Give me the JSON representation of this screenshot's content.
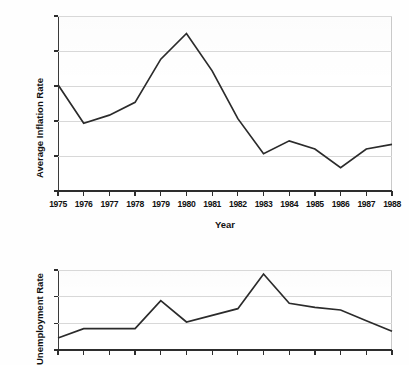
{
  "document": {
    "kind": "scanned-figure-page",
    "background_color": "#ffffff",
    "line_color": "#2b2b2b",
    "grid_color": "#d8d8d8",
    "axis_color": "#2d2d2d"
  },
  "charts": [
    {
      "id": "inflation",
      "ylabel": "Average Inflation Rate",
      "xlabel": "Year"
    },
    {
      "id": "unemployment",
      "ylabel": "Unemployment Rate",
      "xlabel": ""
    }
  ],
  "chart_data": [
    {
      "type": "line",
      "title": "",
      "xlabel": "Year",
      "ylabel": "Average Inflation Rate",
      "categories": [
        "1975",
        "1976",
        "1977",
        "1978",
        "1979",
        "1980",
        "1981",
        "1982",
        "1983",
        "1984",
        "1985",
        "1986",
        "1987",
        "1988"
      ],
      "x": [
        1975,
        1976,
        1977,
        1978,
        1979,
        1980,
        1981,
        1982,
        1983,
        1984,
        1985,
        1986,
        1987,
        1988
      ],
      "values": [
        9.1,
        5.8,
        6.5,
        7.6,
        11.3,
        13.5,
        10.3,
        6.2,
        3.2,
        4.3,
        3.6,
        2.0,
        3.6,
        4.0
      ],
      "ylim": [
        0,
        15
      ],
      "yticks": [
        0,
        3,
        6,
        9,
        12,
        15
      ],
      "ytick_labels": [
        "0",
        "3",
        "6",
        "9",
        "12",
        "15"
      ],
      "xtick_labels": [
        "1975",
        "1976",
        "1977",
        "1978",
        "1979",
        "1980",
        "1981",
        "1982",
        "1983",
        "1984",
        "1985",
        "1986",
        "1987",
        "1988"
      ],
      "grid": true,
      "legend": false,
      "legend_position": "none",
      "series": [
        {
          "name": "Average Inflation Rate",
          "values": [
            9.1,
            5.8,
            6.5,
            7.6,
            11.3,
            13.5,
            10.3,
            6.2,
            3.2,
            4.3,
            3.6,
            2.0,
            3.6,
            4.0
          ]
        }
      ]
    },
    {
      "type": "line",
      "title": "",
      "xlabel": "",
      "ylabel": "Unemployment Rate",
      "categories": [
        "1975",
        "1976",
        "1977",
        "1978",
        "1979",
        "1980",
        "1981",
        "1982",
        "1983",
        "1984",
        "1985",
        "1986",
        "1987",
        "1988"
      ],
      "x": [
        1975,
        1976,
        1977,
        1978,
        1979,
        1980,
        1981,
        1982,
        1983,
        1984,
        1985,
        1986,
        1987,
        1988
      ],
      "values": [
        4.9,
        5.6,
        5.6,
        5.6,
        7.7,
        6.1,
        6.6,
        7.1,
        9.7,
        7.5,
        7.2,
        7.0,
        6.2,
        5.4
      ],
      "ylim": [
        4,
        10
      ],
      "yticks": [
        4,
        6,
        8,
        10
      ],
      "ytick_labels": [
        "4",
        "6",
        "8",
        "10"
      ],
      "xtick_labels": [],
      "grid": true,
      "legend": false,
      "legend_position": "none",
      "note": "lower portion of this chart is cropped by the image edge",
      "series": [
        {
          "name": "Unemployment Rate",
          "values": [
            4.9,
            5.6,
            5.6,
            5.6,
            7.7,
            6.1,
            6.6,
            7.1,
            9.7,
            7.5,
            7.2,
            7.0,
            6.2,
            5.4
          ]
        }
      ]
    }
  ]
}
